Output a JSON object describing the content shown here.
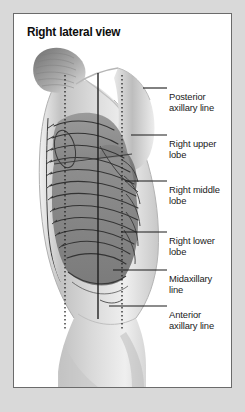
{
  "figure": {
    "title": "Right lateral view",
    "view": "right lateral",
    "background_color": "#d9d9d9",
    "panel_color": "#ffffff",
    "border_color": "#6b6b6b"
  },
  "labels": [
    {
      "id": "posterior-axillary-line",
      "line1": "Posterior",
      "line2": "axillary line",
      "text": "Posterior axillary line",
      "x": 168,
      "y": 83,
      "leader_y": 87,
      "leader_x1": 142,
      "leader_x2": 166
    },
    {
      "id": "right-upper-lobe",
      "line1": "Right upper",
      "line2": "lobe",
      "text": "Right upper lobe",
      "x": 168,
      "y": 130,
      "leader_y": 134,
      "leader_x1": 130,
      "leader_x2": 166
    },
    {
      "id": "right-middle-lobe",
      "line1": "Right middle",
      "line2": "lobe",
      "text": "Right middle lobe",
      "x": 168,
      "y": 176,
      "leader_y": 180,
      "leader_x1": 124,
      "leader_x2": 166
    },
    {
      "id": "right-lower-lobe",
      "line1": "Right lower",
      "line2": "lobe",
      "text": "Right lower lobe",
      "x": 168,
      "y": 227,
      "leader_y": 231,
      "leader_x1": 120,
      "leader_x2": 166
    },
    {
      "id": "midaxillary-line",
      "line1": "Midaxillary",
      "line2": "line",
      "text": "Midaxillary line",
      "x": 168,
      "y": 265,
      "leader_y": 269,
      "leader_x1": 112,
      "leader_x2": 166
    },
    {
      "id": "anterior-axillary-line",
      "line1": "Anterior",
      "line2": "axillary line",
      "text": "Anterior axillary line",
      "x": 168,
      "y": 301,
      "leader_y": 305,
      "leader_x1": 108,
      "leader_x2": 166
    }
  ],
  "reference_lines": [
    {
      "id": "posterior-axillary-vertical",
      "style": "dotted",
      "x": 51,
      "y_top": 74,
      "y_bottom": 330
    },
    {
      "id": "midaxillary-vertical",
      "style": "solid",
      "x": 84,
      "y_top": 72,
      "y_bottom": 318
    },
    {
      "id": "anterior-axillary-vertical",
      "style": "dotted",
      "x": 108,
      "y_top": 74,
      "y_bottom": 330
    }
  ],
  "anatomy": {
    "lobes": [
      {
        "name": "Right upper lobe",
        "shade": "#909090"
      },
      {
        "name": "Right middle lobe",
        "shade": "#787878"
      },
      {
        "name": "Right lower lobe",
        "shade": "#858585"
      }
    ],
    "structures": [
      "hair",
      "shoulder",
      "arm",
      "vertebral column",
      "ribs",
      "scapula",
      "hip",
      "thigh"
    ],
    "skin_tone": "#c9c9c9",
    "rib_color": "#3c3c3c"
  }
}
